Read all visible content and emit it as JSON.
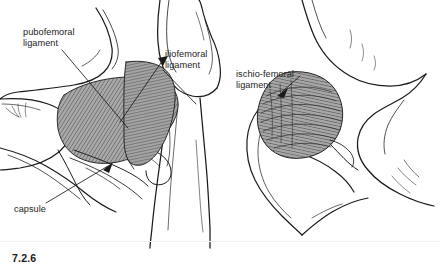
{
  "figure": {
    "number": "7.2.6",
    "background_color": "#ffffff",
    "rule_color": "#f2f2f2",
    "ink_color": "#1a1a1a",
    "text_color": "#232323",
    "ligament_fill": "#a8a8a8",
    "ligament_hatch": "#3a3a3a",
    "bone_fill": "#ffffff"
  },
  "labels": {
    "pubofemoral": "pubofemoral\nligament",
    "iliofemoral": "iliofemoral\nligament",
    "ischiofemoral": "ischio-femoral\nligament",
    "capsule": "capsule"
  },
  "panels": [
    {
      "name": "anterior-hip-view",
      "view": "anterior",
      "labels": [
        "pubofemoral",
        "iliofemoral",
        "capsule"
      ]
    },
    {
      "name": "posterior-hip-view",
      "view": "posterior",
      "labels": [
        "ischiofemoral"
      ]
    }
  ]
}
